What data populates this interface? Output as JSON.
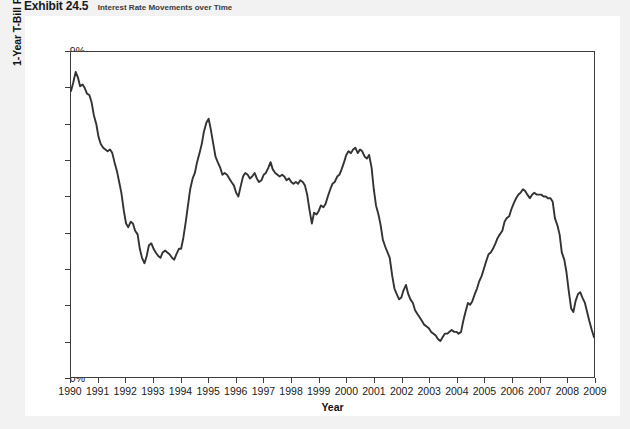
{
  "exhibit": {
    "number": "Exhibit 24.5",
    "caption": "Interest Rate Movements over Time"
  },
  "chart_data": {
    "type": "line",
    "title": "Interest Rate Movements over Time",
    "xlabel": "Year",
    "ylabel": "1-Year T-Bill Rate",
    "xlim": [
      1990,
      2009
    ],
    "ylim": [
      0,
      9
    ],
    "grid": false,
    "legend": null,
    "y_tick_labels": [
      "0%",
      "1%",
      "2%",
      "3%",
      "4%",
      "5%",
      "6%",
      "7%",
      "8%",
      "9%"
    ],
    "y_ticks": [
      0,
      1,
      2,
      3,
      4,
      5,
      6,
      7,
      8,
      9
    ],
    "x_tick_labels": [
      "1990",
      "1991",
      "1992",
      "1993",
      "1994",
      "1995",
      "1996",
      "1997",
      "1998",
      "1999",
      "2000",
      "2001",
      "2002",
      "2003",
      "2004",
      "2005",
      "2006",
      "2007",
      "2008",
      "2009"
    ],
    "x_ticks": [
      1990,
      1991,
      1992,
      1993,
      1994,
      1995,
      1996,
      1997,
      1998,
      1999,
      2000,
      2001,
      2002,
      2003,
      2004,
      2005,
      2006,
      2007,
      2008,
      2009
    ],
    "line_color": "#333333",
    "series": [
      {
        "name": "1-Year T-Bill Rate",
        "x": [
          1990.0,
          1990.08,
          1990.17,
          1990.25,
          1990.33,
          1990.42,
          1990.5,
          1990.58,
          1990.67,
          1990.75,
          1990.83,
          1990.92,
          1991.0,
          1991.08,
          1991.17,
          1991.25,
          1991.33,
          1991.42,
          1991.5,
          1991.58,
          1991.67,
          1991.75,
          1991.83,
          1991.92,
          1992.0,
          1992.08,
          1992.17,
          1992.25,
          1992.33,
          1992.42,
          1992.5,
          1992.58,
          1992.67,
          1992.75,
          1992.83,
          1992.92,
          1993.0,
          1993.08,
          1993.17,
          1993.25,
          1993.33,
          1993.42,
          1993.5,
          1993.58,
          1993.67,
          1993.75,
          1993.83,
          1993.92,
          1994.0,
          1994.08,
          1994.17,
          1994.25,
          1994.33,
          1994.42,
          1994.5,
          1994.58,
          1994.67,
          1994.75,
          1994.83,
          1994.92,
          1995.0,
          1995.08,
          1995.17,
          1995.25,
          1995.33,
          1995.42,
          1995.5,
          1995.58,
          1995.67,
          1995.75,
          1995.83,
          1995.92,
          1996.0,
          1996.08,
          1996.17,
          1996.25,
          1996.33,
          1996.42,
          1996.5,
          1996.58,
          1996.67,
          1996.75,
          1996.83,
          1996.92,
          1997.0,
          1997.08,
          1997.17,
          1997.25,
          1997.33,
          1997.42,
          1997.5,
          1997.58,
          1997.67,
          1997.75,
          1997.83,
          1997.92,
          1998.0,
          1998.08,
          1998.17,
          1998.25,
          1998.33,
          1998.42,
          1998.5,
          1998.58,
          1998.67,
          1998.75,
          1998.83,
          1998.92,
          1999.0,
          1999.08,
          1999.17,
          1999.25,
          1999.33,
          1999.42,
          1999.5,
          1999.58,
          1999.67,
          1999.75,
          1999.83,
          1999.92,
          2000.0,
          2000.08,
          2000.17,
          2000.25,
          2000.33,
          2000.42,
          2000.5,
          2000.58,
          2000.67,
          2000.75,
          2000.83,
          2000.92,
          2001.0,
          2001.08,
          2001.17,
          2001.25,
          2001.33,
          2001.42,
          2001.5,
          2001.58,
          2001.67,
          2001.75,
          2001.83,
          2001.92,
          2002.0,
          2002.08,
          2002.17,
          2002.25,
          2002.33,
          2002.42,
          2002.5,
          2002.58,
          2002.67,
          2002.75,
          2002.83,
          2002.92,
          2003.0,
          2003.08,
          2003.17,
          2003.25,
          2003.33,
          2003.42,
          2003.5,
          2003.58,
          2003.67,
          2003.75,
          2003.83,
          2003.92,
          2004.0,
          2004.08,
          2004.17,
          2004.25,
          2004.33,
          2004.42,
          2004.5,
          2004.58,
          2004.67,
          2004.75,
          2004.83,
          2004.92,
          2005.0,
          2005.08,
          2005.17,
          2005.25,
          2005.33,
          2005.42,
          2005.5,
          2005.58,
          2005.67,
          2005.75,
          2005.83,
          2005.92,
          2006.0,
          2006.08,
          2006.17,
          2006.25,
          2006.33,
          2006.42,
          2006.5,
          2006.58,
          2006.67,
          2006.75,
          2006.83,
          2006.92,
          2007.0,
          2007.08,
          2007.17,
          2007.25,
          2007.33,
          2007.42,
          2007.5,
          2007.58,
          2007.67,
          2007.75,
          2007.83,
          2007.92,
          2008.0,
          2008.08,
          2008.17,
          2008.25,
          2008.33,
          2008.42,
          2008.5,
          2008.58,
          2008.67,
          2008.75,
          2008.83,
          2008.92,
          2009.0
        ],
        "values": [
          7.92,
          8.15,
          8.45,
          8.3,
          8.05,
          8.1,
          8.0,
          7.85,
          7.8,
          7.6,
          7.25,
          7.0,
          6.65,
          6.45,
          6.35,
          6.3,
          6.25,
          6.3,
          6.2,
          5.95,
          5.7,
          5.4,
          5.1,
          4.6,
          4.25,
          4.15,
          4.3,
          4.25,
          4.05,
          3.95,
          3.55,
          3.3,
          3.15,
          3.35,
          3.65,
          3.7,
          3.55,
          3.45,
          3.35,
          3.3,
          3.45,
          3.5,
          3.45,
          3.4,
          3.3,
          3.25,
          3.4,
          3.55,
          3.55,
          3.85,
          4.3,
          4.75,
          5.2,
          5.5,
          5.65,
          5.95,
          6.2,
          6.45,
          6.8,
          7.05,
          7.15,
          6.85,
          6.45,
          6.1,
          5.95,
          5.8,
          5.6,
          5.65,
          5.6,
          5.5,
          5.4,
          5.3,
          5.1,
          5.0,
          5.3,
          5.55,
          5.65,
          5.6,
          5.5,
          5.55,
          5.65,
          5.5,
          5.4,
          5.45,
          5.6,
          5.65,
          5.8,
          5.95,
          5.75,
          5.65,
          5.6,
          5.55,
          5.6,
          5.55,
          5.45,
          5.5,
          5.4,
          5.35,
          5.4,
          5.35,
          5.45,
          5.4,
          5.3,
          5.05,
          4.6,
          4.25,
          4.55,
          4.5,
          4.6,
          4.75,
          4.7,
          4.8,
          5.0,
          5.2,
          5.35,
          5.4,
          5.55,
          5.6,
          5.75,
          5.95,
          6.15,
          6.25,
          6.2,
          6.3,
          6.35,
          6.2,
          6.3,
          6.25,
          6.1,
          6.05,
          6.15,
          5.8,
          5.2,
          4.75,
          4.5,
          4.2,
          3.8,
          3.6,
          3.45,
          3.3,
          2.8,
          2.45,
          2.3,
          2.15,
          2.2,
          2.4,
          2.55,
          2.3,
          2.15,
          2.05,
          1.85,
          1.75,
          1.65,
          1.55,
          1.45,
          1.4,
          1.35,
          1.25,
          1.2,
          1.15,
          1.05,
          1.0,
          1.1,
          1.2,
          1.2,
          1.25,
          1.3,
          1.25,
          1.25,
          1.2,
          1.25,
          1.55,
          1.8,
          2.05,
          2.0,
          2.1,
          2.3,
          2.45,
          2.65,
          2.8,
          3.0,
          3.2,
          3.4,
          3.45,
          3.55,
          3.7,
          3.85,
          3.95,
          4.05,
          4.3,
          4.4,
          4.45,
          4.65,
          4.8,
          4.95,
          5.05,
          5.1,
          5.2,
          5.15,
          5.05,
          4.95,
          5.05,
          5.1,
          5.05,
          5.05,
          5.05,
          5.0,
          5.0,
          4.95,
          4.95,
          4.85,
          4.4,
          4.2,
          3.95,
          3.45,
          3.25,
          2.9,
          2.4,
          1.9,
          1.8,
          2.1,
          2.3,
          2.35,
          2.2,
          2.05,
          1.8,
          1.55,
          1.3,
          1.1
        ]
      }
    ]
  }
}
